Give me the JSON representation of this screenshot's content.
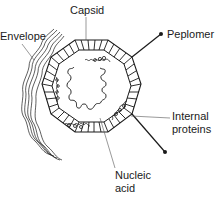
{
  "diagram": {
    "labels": {
      "capsid": "Capsid",
      "envelope": "Envelope",
      "peplomer": "Peplomer",
      "internal_proteins_line1": "Internal",
      "internal_proteins_line2": "proteins",
      "nucleic_acid_line1": "Nucleic",
      "nucleic_acid_line2": "acid"
    },
    "components": [
      "Capsid",
      "Envelope",
      "Peplomer",
      "Internal proteins",
      "Nucleic acid"
    ],
    "colors": {
      "stroke": "#1a1a1a",
      "leader": "#555555",
      "background": "#ffffff"
    }
  }
}
